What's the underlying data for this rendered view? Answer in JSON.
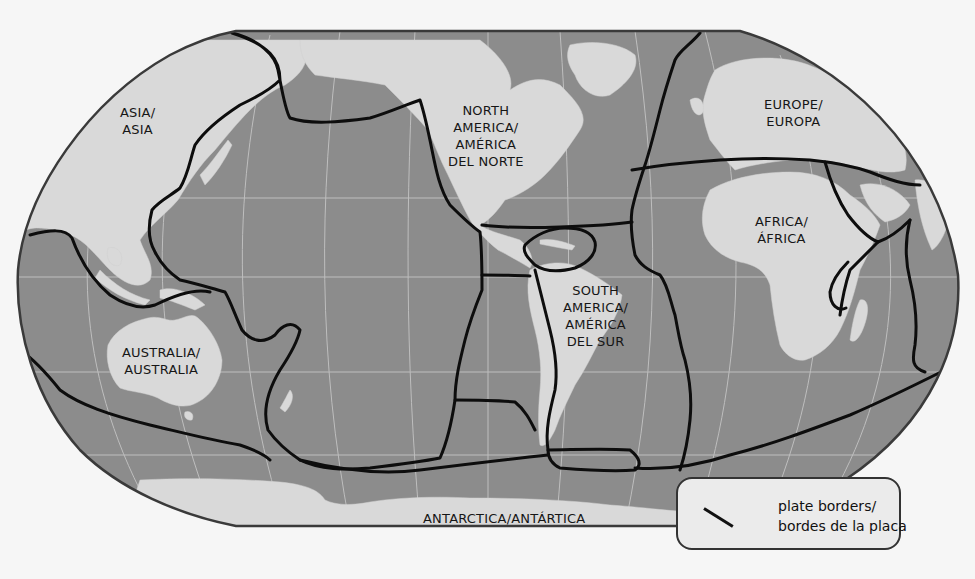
{
  "map": {
    "type": "world-map-tectonic-plates",
    "projection": "robinson",
    "colors": {
      "background": "#f6f6f6",
      "ocean": "#8c8c8c",
      "land": "#d9d9d9",
      "graticule": "#c4c4c4",
      "plate_border": "#0d0d0d",
      "outline": "#3a3a3a"
    }
  },
  "labels": {
    "asia": [
      "ASIA/",
      "ASIA"
    ],
    "north_america": [
      "NORTH",
      "AMERICA/",
      "AMÉRICA",
      "DEL NORTE"
    ],
    "europe": [
      "EUROPE/",
      "EUROPA"
    ],
    "africa": [
      "AFRICA/",
      "ÁFRICA"
    ],
    "south_america": [
      "SOUTH",
      "AMERICA/",
      "AMÉRICA",
      "DEL SUR"
    ],
    "australia": [
      "AUSTRALIA/",
      "AUSTRALIA"
    ],
    "antarctica": "ANTARCTICA/ANTÁRTICA"
  },
  "legend": {
    "symbol": "plate-border-line",
    "line1": "plate borders/",
    "line2": "bordes de la placa"
  }
}
